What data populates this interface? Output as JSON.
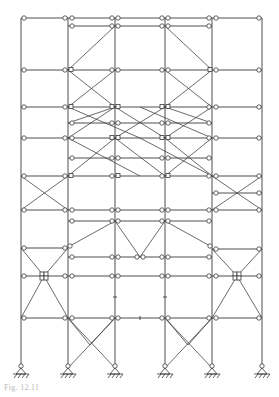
{
  "figure": {
    "type": "structural-frame-diagram",
    "caption": "Fig. 12.11",
    "columns_x": [
      21,
      68,
      115,
      165,
      212,
      262
    ],
    "support_count": 6,
    "line_color": "#3a3a3a",
    "hinge_fill": "#ffffff",
    "caption_color": "#b8b8b8"
  }
}
